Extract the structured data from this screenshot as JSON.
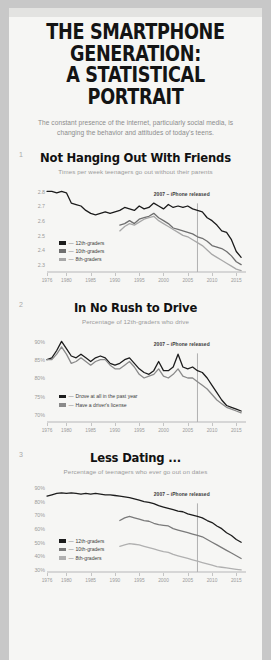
{
  "header": {
    "title": "THE SMARTPHONE GENERATION: A STATISTICAL PORTRAIT",
    "title_line1": "THE SMARTPHONE GENERATION:",
    "title_line2": "A STATISTICAL PORTRAIT",
    "deck": "The constant presence of the internet, particularly social media, is changing the behavior and attitudes of today's teens."
  },
  "colors": {
    "page_background": "#f6f6f4",
    "outer_background": "#c8c8c8",
    "series_dark": "#1c1c1c",
    "series_mid": "#6f6f6f",
    "series_light": "#a8a8a8",
    "annotation_rule": "#b0b0b0",
    "tick_text": "#9b9b9b"
  },
  "annotation_label": "2007 – iPhone released",
  "chart_data": [
    {
      "type": "line",
      "number": "1",
      "title": "Not Hanging Out With Friends",
      "subtitle": "Times per week teenagers go out without their parents",
      "xlabel": "",
      "ylabel": "",
      "xlim": [
        1976,
        2017
      ],
      "ylim": [
        2.25,
        2.85
      ],
      "yticks": [
        2.8,
        2.7,
        2.6,
        2.5,
        2.4,
        2.3
      ],
      "ytick_labels": [
        "2.8",
        "2.7",
        "2.6",
        "2.5",
        "2.4",
        "2.3"
      ],
      "xticks": [
        1976,
        1980,
        1985,
        1990,
        1995,
        2000,
        2005,
        2010,
        2015
      ],
      "xtick_labels": [
        "1976",
        "1980",
        "1985",
        "1990",
        "1995",
        "2000",
        "2005",
        "2010",
        "2015"
      ],
      "grid": false,
      "legend_position": "bottom-left",
      "annotation_x": 2007,
      "series": [
        {
          "name": "12th-graders",
          "color": "#1c1c1c",
          "x": [
            1976,
            1977,
            1978,
            1979,
            1980,
            1981,
            1982,
            1983,
            1984,
            1985,
            1986,
            1987,
            1988,
            1989,
            1990,
            1991,
            1992,
            1993,
            1994,
            1995,
            1996,
            1997,
            1998,
            1999,
            2000,
            2001,
            2002,
            2003,
            2004,
            2005,
            2006,
            2007,
            2008,
            2009,
            2010,
            2011,
            2012,
            2013,
            2014,
            2015,
            2016
          ],
          "values": [
            2.8,
            2.8,
            2.79,
            2.8,
            2.79,
            2.72,
            2.71,
            2.7,
            2.67,
            2.65,
            2.64,
            2.65,
            2.66,
            2.65,
            2.66,
            2.67,
            2.69,
            2.68,
            2.67,
            2.7,
            2.68,
            2.69,
            2.72,
            2.7,
            2.68,
            2.71,
            2.69,
            2.7,
            2.69,
            2.7,
            2.68,
            2.67,
            2.66,
            2.62,
            2.6,
            2.57,
            2.53,
            2.52,
            2.47,
            2.39,
            2.35
          ]
        },
        {
          "name": "10th-graders",
          "color": "#6f6f6f",
          "x": [
            1991,
            1992,
            1993,
            1994,
            1995,
            1996,
            1997,
            1998,
            1999,
            2000,
            2001,
            2002,
            2003,
            2004,
            2005,
            2006,
            2007,
            2008,
            2009,
            2010,
            2011,
            2012,
            2013,
            2014,
            2015,
            2016
          ],
          "values": [
            2.57,
            2.58,
            2.6,
            2.58,
            2.61,
            2.62,
            2.63,
            2.65,
            2.62,
            2.6,
            2.58,
            2.55,
            2.54,
            2.53,
            2.52,
            2.51,
            2.49,
            2.48,
            2.46,
            2.43,
            2.42,
            2.41,
            2.39,
            2.36,
            2.32,
            2.3
          ]
        },
        {
          "name": "8th-graders",
          "color": "#a8a8a8",
          "x": [
            1991,
            1992,
            1993,
            1994,
            1995,
            1996,
            1997,
            1998,
            1999,
            2000,
            2001,
            2002,
            2003,
            2004,
            2005,
            2006,
            2007,
            2008,
            2009,
            2010,
            2011,
            2012,
            2013,
            2014,
            2015,
            2016
          ],
          "values": [
            2.53,
            2.56,
            2.58,
            2.57,
            2.59,
            2.61,
            2.62,
            2.63,
            2.6,
            2.58,
            2.56,
            2.54,
            2.52,
            2.5,
            2.49,
            2.47,
            2.45,
            2.43,
            2.4,
            2.37,
            2.35,
            2.33,
            2.31,
            2.29,
            2.27,
            2.26
          ]
        }
      ],
      "legend": [
        {
          "label": "12th-graders",
          "color": "#1c1c1c"
        },
        {
          "label": "10th-graders",
          "color": "#6f6f6f"
        },
        {
          "label": "8th-graders",
          "color": "#a8a8a8"
        }
      ]
    },
    {
      "type": "line",
      "number": "2",
      "title": "In No Rush to Drive",
      "subtitle": "Percentage of 12th-graders who drive",
      "xlabel": "",
      "ylabel": "",
      "xlim": [
        1976,
        2017
      ],
      "ylim": [
        68,
        92
      ],
      "yticks": [
        90,
        85,
        80,
        75,
        70
      ],
      "ytick_labels": [
        "90%",
        "85%",
        "80%",
        "75%",
        "70%"
      ],
      "xticks": [
        1976,
        1980,
        1985,
        1990,
        1995,
        2000,
        2005,
        2010,
        2015
      ],
      "xtick_labels": [
        "1976",
        "1980",
        "1985",
        "1990",
        "1995",
        "2000",
        "2005",
        "2010",
        "2015"
      ],
      "grid": false,
      "legend_position": "bottom-left",
      "annotation_x": 2007,
      "series": [
        {
          "name": "Drove at all in the past year",
          "color": "#1c1c1c",
          "x": [
            1976,
            1977,
            1978,
            1979,
            1980,
            1981,
            1982,
            1983,
            1984,
            1985,
            1986,
            1987,
            1988,
            1989,
            1990,
            1991,
            1992,
            1993,
            1994,
            1995,
            1996,
            1997,
            1998,
            1999,
            2000,
            2001,
            2002,
            2003,
            2004,
            2005,
            2006,
            2007,
            2008,
            2009,
            2010,
            2011,
            2012,
            2013,
            2014,
            2015,
            2016
          ],
          "values": [
            85.0,
            85.5,
            87.5,
            90.0,
            88.0,
            86.0,
            85.5,
            86.5,
            85.5,
            84.5,
            85.5,
            86.0,
            85.5,
            84.0,
            83.5,
            84.0,
            85.0,
            85.5,
            84.0,
            82.5,
            81.5,
            81.0,
            82.0,
            84.5,
            82.0,
            82.0,
            83.0,
            86.5,
            83.0,
            82.5,
            83.0,
            82.0,
            81.5,
            80.0,
            78.0,
            76.0,
            74.0,
            72.5,
            72.0,
            71.5,
            71.0
          ]
        },
        {
          "name": "Have a driver's license",
          "color": "#8a8a8a",
          "x": [
            1976,
            1977,
            1978,
            1979,
            1980,
            1981,
            1982,
            1983,
            1984,
            1985,
            1986,
            1987,
            1988,
            1989,
            1990,
            1991,
            1992,
            1993,
            1994,
            1995,
            1996,
            1997,
            1998,
            1999,
            2000,
            2001,
            2002,
            2003,
            2004,
            2005,
            2006,
            2007,
            2008,
            2009,
            2010,
            2011,
            2012,
            2013,
            2014,
            2015,
            2016
          ],
          "values": [
            85.0,
            85.0,
            86.5,
            88.5,
            86.5,
            84.0,
            84.5,
            85.5,
            84.5,
            83.5,
            84.5,
            85.0,
            85.0,
            83.5,
            82.5,
            82.5,
            83.5,
            84.5,
            83.0,
            81.0,
            80.0,
            80.5,
            81.0,
            82.5,
            80.5,
            80.0,
            81.0,
            82.5,
            80.5,
            80.0,
            80.0,
            79.0,
            78.0,
            77.0,
            75.5,
            74.0,
            73.0,
            72.0,
            71.5,
            71.0,
            70.5
          ]
        }
      ],
      "legend": [
        {
          "label": "Drove at all in the past year",
          "color": "#1c1c1c"
        },
        {
          "label": "Have a driver's license",
          "color": "#8a8a8a"
        }
      ]
    },
    {
      "type": "line",
      "number": "3",
      "title": "Less Dating ...",
      "subtitle": "Percentage of teenagers who ever go out on dates",
      "xlabel": "",
      "ylabel": "",
      "xlim": [
        1976,
        2017
      ],
      "ylim": [
        28,
        93
      ],
      "yticks": [
        90,
        80,
        70,
        60,
        50,
        40,
        30
      ],
      "ytick_labels": [
        "90%",
        "80%",
        "70%",
        "60%",
        "50%",
        "40%",
        "30%"
      ],
      "xticks": [
        1976,
        1980,
        1985,
        1990,
        1995,
        2000,
        2005,
        2010,
        2015
      ],
      "xtick_labels": [
        "1976",
        "1980",
        "1985",
        "1990",
        "1995",
        "2000",
        "2005",
        "2010",
        "2015"
      ],
      "grid": false,
      "legend_position": "bottom-left",
      "annotation_x": 2007,
      "series": [
        {
          "name": "12th-graders",
          "color": "#1c1c1c",
          "x": [
            1976,
            1977,
            1978,
            1979,
            1980,
            1981,
            1982,
            1983,
            1984,
            1985,
            1986,
            1987,
            1988,
            1989,
            1990,
            1991,
            1992,
            1993,
            1994,
            1995,
            1996,
            1997,
            1998,
            1999,
            2000,
            2001,
            2002,
            2003,
            2004,
            2005,
            2006,
            2007,
            2008,
            2009,
            2010,
            2011,
            2012,
            2013,
            2014,
            2015,
            2016
          ],
          "values": [
            84.0,
            85.0,
            86.0,
            86.5,
            86.0,
            86.5,
            86.0,
            85.5,
            86.0,
            85.5,
            86.0,
            85.5,
            85.0,
            85.0,
            84.5,
            84.0,
            83.5,
            83.0,
            82.0,
            81.0,
            80.0,
            79.5,
            78.5,
            77.0,
            76.0,
            75.0,
            74.0,
            73.0,
            72.5,
            71.0,
            70.0,
            69.0,
            68.0,
            66.0,
            64.5,
            62.0,
            60.0,
            57.0,
            55.0,
            52.0,
            50.0
          ]
        },
        {
          "name": "10th-graders",
          "color": "#7a7a7a",
          "x": [
            1991,
            1992,
            1993,
            1994,
            1995,
            1996,
            1997,
            1998,
            1999,
            2000,
            2001,
            2002,
            2003,
            2004,
            2005,
            2006,
            2007,
            2008,
            2009,
            2010,
            2011,
            2012,
            2013,
            2014,
            2015,
            2016
          ],
          "values": [
            66.0,
            68.0,
            69.0,
            68.0,
            67.0,
            66.0,
            65.5,
            64.0,
            63.0,
            62.5,
            62.0,
            60.0,
            59.0,
            58.0,
            57.0,
            56.0,
            55.0,
            54.0,
            52.0,
            50.0,
            48.0,
            46.0,
            44.0,
            42.0,
            40.0,
            38.0
          ]
        },
        {
          "name": "8th-graders",
          "color": "#b0b0b0",
          "x": [
            1991,
            1992,
            1993,
            1994,
            1995,
            1996,
            1997,
            1998,
            1999,
            2000,
            2001,
            2002,
            2003,
            2004,
            2005,
            2006,
            2007,
            2008,
            2009,
            2010,
            2011,
            2012,
            2013,
            2014,
            2015,
            2016
          ],
          "values": [
            47.0,
            48.0,
            49.0,
            48.5,
            48.0,
            47.0,
            46.0,
            45.0,
            44.0,
            43.0,
            42.5,
            41.0,
            40.0,
            39.0,
            38.0,
            37.0,
            36.0,
            35.0,
            34.0,
            33.0,
            32.0,
            31.5,
            31.0,
            30.5,
            30.0,
            29.5
          ]
        }
      ],
      "legend": [
        {
          "label": "12th-graders",
          "color": "#1c1c1c"
        },
        {
          "label": "10th-graders",
          "color": "#7a7a7a"
        },
        {
          "label": "8th-graders",
          "color": "#b0b0b0"
        }
      ]
    }
  ]
}
